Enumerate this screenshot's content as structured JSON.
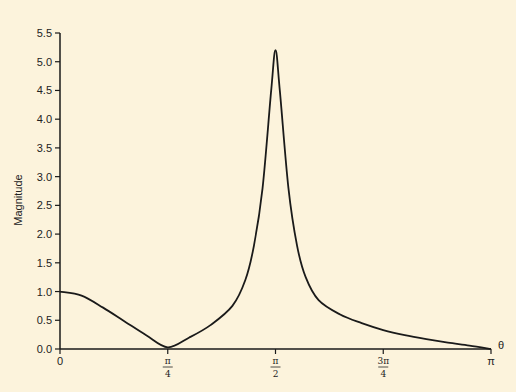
{
  "chart_data": {
    "type": "line",
    "title": "",
    "xlabel": "θ",
    "ylabel": "Magnitude",
    "xlim": [
      0,
      3.14159
    ],
    "ylim": [
      0,
      5.5
    ],
    "grid": false,
    "legend": null,
    "x_ticks": [
      {
        "value": 0,
        "label": "0"
      },
      {
        "value": 0.7854,
        "num": "π",
        "den": "4"
      },
      {
        "value": 1.5708,
        "num": "π",
        "den": "2"
      },
      {
        "value": 2.3562,
        "num": "3π",
        "den": "4"
      },
      {
        "value": 3.14159,
        "label": "π"
      }
    ],
    "y_ticks": [
      "0.0",
      "0.5",
      "1.0",
      "1.5",
      "2.0",
      "2.5",
      "3.0",
      "3.5",
      "4.0",
      "4.5",
      "5.0",
      "5.5"
    ],
    "series": [
      {
        "name": "Magnitude",
        "color": "#1a1a1a",
        "x_over_pi": [
          0,
          0.05,
          0.1,
          0.15,
          0.2,
          0.25,
          0.3,
          0.35,
          0.4,
          0.43,
          0.45,
          0.47,
          0.49,
          0.5,
          0.51,
          0.53,
          0.55,
          0.57,
          0.6,
          0.65,
          0.7,
          0.75,
          0.8,
          0.85,
          0.9,
          0.95,
          1.0
        ],
        "values": [
          1.0,
          0.93,
          0.72,
          0.48,
          0.24,
          0.03,
          0.2,
          0.42,
          0.75,
          1.2,
          1.8,
          2.8,
          4.5,
          5.2,
          4.5,
          2.8,
          1.8,
          1.25,
          0.85,
          0.6,
          0.45,
          0.33,
          0.24,
          0.17,
          0.11,
          0.06,
          0.0
        ]
      }
    ]
  },
  "colors": {
    "background": "#fcf3dc",
    "axis": "#1a1a1a",
    "curve": "#1a1a1a"
  }
}
